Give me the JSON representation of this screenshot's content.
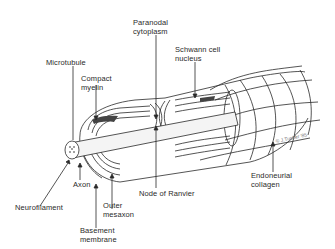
{
  "figure": {
    "labels": {
      "microtubule": "Microtubule",
      "compact_myelin": "Compact\nmyelin",
      "paranodal_cytoplasm": "Paranodal\ncytoplasm",
      "schwann_cell_nucleus": "Schwann cell\nnucleus",
      "neurofilament": "Neurofilament",
      "axon": "Axon",
      "outer_mesaxon": "Outer\nmesaxon",
      "basement_membrane": "Basement\nmembrane",
      "node_of_ranvier": "Node of Ranvier",
      "endoneurial_collagen": "Endoneurial\ncollagen"
    },
    "colors": {
      "ink": "#2a2a2a",
      "background": "#ffffff",
      "axon_fill": "#f4f4f4"
    }
  }
}
